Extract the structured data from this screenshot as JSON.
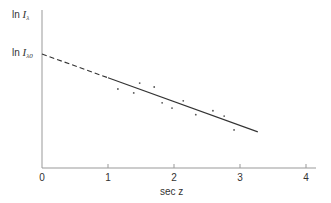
{
  "chart_data": {
    "type": "scatter",
    "title": "",
    "xlabel": "sec z",
    "ylabel": "ln I_λ",
    "xlim": [
      0,
      4.2
    ],
    "x_ticks": [
      "0",
      "1",
      "2",
      "3",
      "4"
    ],
    "y_tick_labels": [
      {
        "label": "ln I_λ0",
        "value": 0
      }
    ],
    "grid": false,
    "legend": null,
    "series": [
      {
        "name": "observations",
        "kind": "points",
        "x": [
          1.15,
          1.39,
          1.48,
          1.7,
          1.82,
          1.97,
          2.14,
          2.33,
          2.59,
          2.76,
          2.91
        ],
        "y": [
          -0.53,
          -0.59,
          -0.44,
          -0.5,
          -0.74,
          -0.82,
          -0.71,
          -0.92,
          -0.86,
          -0.94,
          -1.15
        ]
      },
      {
        "name": "fit line (solid)",
        "kind": "line",
        "x": [
          1.0,
          3.27
        ],
        "y": [
          -0.36,
          -1.18
        ]
      },
      {
        "name": "extrapolation to sec z = 0 (dashed)",
        "kind": "dashed-line",
        "x": [
          0,
          1.0
        ],
        "y": [
          0,
          -0.36
        ]
      }
    ],
    "annotations": [
      "ln I_λ0 marks the y-intercept of the extrapolated line at sec z = 0"
    ]
  },
  "labels": {
    "y_axis_prefix": "ln ",
    "y_axis_var": "I",
    "y_axis_sub": "λ",
    "intercept_prefix": "ln ",
    "intercept_var": "I",
    "intercept_sub": "λ0",
    "x_axis_prefix": "sec ",
    "x_axis_var": "z"
  },
  "style": {
    "axis_color": "#999999",
    "line_color": "#333333",
    "point_color": "#555555"
  }
}
